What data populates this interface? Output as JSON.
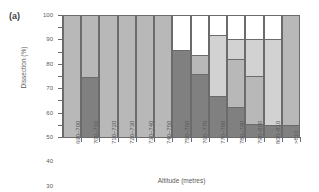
{
  "panel": {
    "label": "(a)"
  },
  "chart_data": {
    "type": "bar",
    "stacked": true,
    "title": "",
    "xlabel": "Altitude (metres)",
    "ylabel": "Dissection (%)",
    "ylim": [
      0,
      100
    ],
    "yticks": [
      0,
      10,
      20,
      30,
      40,
      50,
      60,
      70,
      80,
      90,
      100
    ],
    "grid": false,
    "legend": "none",
    "categories": [
      "690–700",
      "700–710",
      "710–720",
      "720–730",
      "730–740",
      "740–750",
      "750–760",
      "760–770",
      "770–780",
      "780–790",
      "790–800",
      "800–810",
      ">810"
    ],
    "series": [
      {
        "name": "class-1-dark-grey",
        "color": "#808080",
        "values": [
          0,
          49,
          0,
          0,
          0,
          0,
          71,
          52,
          34,
          25,
          11,
          10,
          10
        ]
      },
      {
        "name": "class-2-mid-grey",
        "color": "#b8b8b8",
        "values": [
          100,
          51,
          100,
          100,
          100,
          100,
          0,
          15,
          0,
          39,
          39,
          0,
          90
        ]
      },
      {
        "name": "class-3-light-grey",
        "color": "#d2d2d2",
        "values": [
          0,
          0,
          0,
          0,
          0,
          0,
          0,
          0,
          50,
          16,
          30,
          70,
          0
        ]
      },
      {
        "name": "class-4-white",
        "color": "#ffffff",
        "values": [
          0,
          0,
          0,
          0,
          0,
          0,
          29,
          33,
          16,
          20,
          20,
          20,
          0
        ]
      }
    ]
  }
}
